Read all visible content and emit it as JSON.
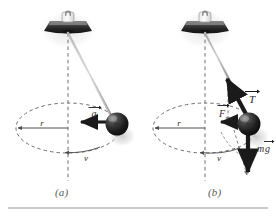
{
  "figure": {
    "background_color": "#ffffff",
    "rule_color": "#b9b9b9",
    "panels": [
      {
        "id": "a",
        "caption": "(a)",
        "description": "Conical pendulum showing radius, speed and centripetal acceleration",
        "labels": {
          "radius": "r",
          "speed": "v",
          "mass": "m",
          "acceleration": "a"
        },
        "vectors": [
          {
            "name": "acceleration",
            "symbol": "a",
            "accent": "arrow",
            "direction": "left-centripetal"
          }
        ]
      },
      {
        "id": "b",
        "caption": "(b)",
        "description": "Conical pendulum showing tension, weight and resultant force",
        "labels": {
          "radius": "r",
          "speed": "v",
          "mass": "m",
          "tension": "T",
          "resultant_force": "F",
          "resultant_subscript": "res",
          "weight_mass": "m",
          "weight_gravity": "g"
        },
        "vectors": [
          {
            "name": "tension",
            "symbol": "T",
            "accent": "arrow",
            "direction": "up-left-along-string"
          },
          {
            "name": "resultant-force",
            "symbol": "F_res",
            "accent": "arrow",
            "direction": "left-horizontal"
          },
          {
            "name": "weight",
            "symbol": "mg",
            "accent": "arrow",
            "direction": "down-vertical"
          }
        ]
      }
    ],
    "colors": {
      "ball_dark": "#1c1c1c",
      "ball_highlight": "#9a9a9a",
      "mount_dark": "#2e2e2e",
      "mount_light": "#d8d8d8",
      "string": "#8a8a8a",
      "dashed": "#6e6e6e",
      "vector_black": "#1a1a1a",
      "shadow": "#cfcfcf"
    }
  }
}
